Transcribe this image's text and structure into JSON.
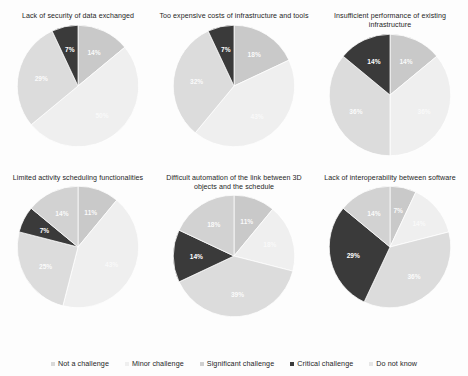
{
  "legend": {
    "position": "bottom",
    "items": [
      {
        "label": "Not a challenge",
        "color": "#d9d9d9"
      },
      {
        "label": "Minor challenge",
        "color": "#efefef"
      },
      {
        "label": "Significant challenge",
        "color": "#cfcfcf"
      },
      {
        "label": "Critical challenge",
        "color": "#3a3a3a"
      },
      {
        "label": "Do not know",
        "color": "#e6e6e6"
      }
    ]
  },
  "chart_data": [
    {
      "type": "pie",
      "title": "Lack of security of data exchanged",
      "categories": [
        "Not a challenge",
        "Minor challenge",
        "Significant challenge",
        "Critical challenge"
      ],
      "values": [
        14,
        50,
        29,
        7
      ],
      "labels": [
        "14%",
        "50%",
        "29%",
        "7%"
      ],
      "colors": [
        "#c9c9c9",
        "#efefef",
        "#dcdcdc",
        "#3a3a3a"
      ]
    },
    {
      "type": "pie",
      "title": "Too expensive costs of infrastructure and tools",
      "categories": [
        "Not a challenge",
        "Minor challenge",
        "Significant challenge",
        "Critical challenge"
      ],
      "values": [
        18,
        43,
        32,
        7
      ],
      "labels": [
        "18%",
        "43%",
        "32%",
        "7%"
      ],
      "colors": [
        "#c9c9c9",
        "#efefef",
        "#dcdcdc",
        "#3a3a3a"
      ]
    },
    {
      "type": "pie",
      "title": "Insufficient performance of existing infrastructure",
      "categories": [
        "Not a challenge",
        "Minor challenge",
        "Significant challenge",
        "Critical challenge"
      ],
      "values": [
        14,
        36,
        36,
        14
      ],
      "labels": [
        "14%",
        "36%",
        "36%",
        "14%"
      ],
      "colors": [
        "#c9c9c9",
        "#efefef",
        "#dcdcdc",
        "#3a3a3a"
      ]
    },
    {
      "type": "pie",
      "title": "Limited activity scheduling functionalities",
      "categories": [
        "Not a challenge",
        "Minor challenge",
        "Significant challenge",
        "Critical challenge",
        "Do not know"
      ],
      "values": [
        11,
        43,
        25,
        7,
        14
      ],
      "labels": [
        "11%",
        "43%",
        "25%",
        "7%",
        "14%"
      ],
      "colors": [
        "#c9c9c9",
        "#efefef",
        "#dcdcdc",
        "#3a3a3a",
        "#d2d2d2"
      ]
    },
    {
      "type": "pie",
      "title": "Difficult automation of the link between 3D objects and the schedule",
      "categories": [
        "Not a challenge",
        "Minor challenge",
        "Significant challenge",
        "Critical challenge",
        "Do not know"
      ],
      "values": [
        11,
        18,
        39,
        14,
        18
      ],
      "labels": [
        "11%",
        "18%",
        "39%",
        "14%",
        "18%"
      ],
      "colors": [
        "#c9c9c9",
        "#efefef",
        "#dcdcdc",
        "#3a3a3a",
        "#d2d2d2"
      ]
    },
    {
      "type": "pie",
      "title": "Lack of interoperability between software",
      "categories": [
        "Not a challenge",
        "Minor challenge",
        "Significant challenge",
        "Critical challenge",
        "Do not know"
      ],
      "values": [
        7,
        14,
        36,
        29,
        14
      ],
      "labels": [
        "7%",
        "14%",
        "36%",
        "29%",
        "14%"
      ],
      "colors": [
        "#c9c9c9",
        "#efefef",
        "#dcdcdc",
        "#3a3a3a",
        "#d2d2d2"
      ]
    }
  ]
}
